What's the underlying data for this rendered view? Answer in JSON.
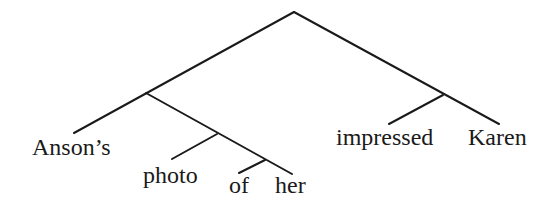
{
  "tree": {
    "leaves": {
      "ansons": "Anson’s",
      "photo": "photo",
      "of": "of",
      "her": "her",
      "impressed": "impressed",
      "karen": "Karen"
    },
    "line_color": "#1a1a1a"
  }
}
